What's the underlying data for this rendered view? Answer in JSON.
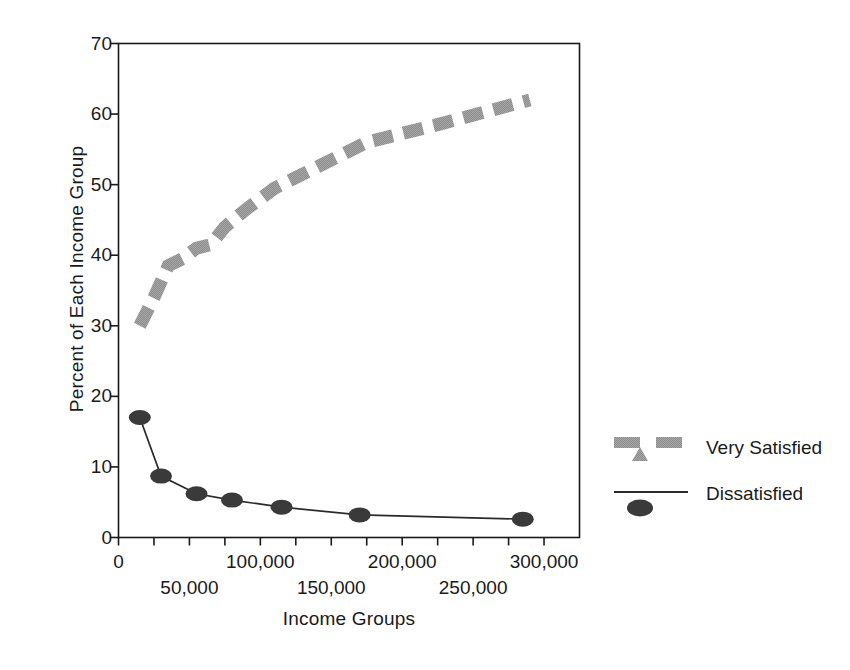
{
  "chart_data": {
    "type": "line",
    "title": "",
    "xlabel": "Income Groups",
    "ylabel": "Percent of Each Income Group",
    "xlim": [
      0,
      325000
    ],
    "ylim": [
      0,
      70
    ],
    "ytick_values": [
      0,
      10,
      20,
      30,
      40,
      50,
      60,
      70
    ],
    "ytick_labels": [
      "0",
      "10",
      "20",
      "30",
      "40",
      "50",
      "60",
      "70"
    ],
    "xtick_values": [
      0,
      25000,
      50000,
      75000,
      100000,
      125000,
      150000,
      175000,
      200000,
      225000,
      250000,
      275000,
      300000
    ],
    "xtick_labels_upper": [
      {
        "value": 0,
        "label": "0"
      },
      {
        "value": 100000,
        "label": "100,000"
      },
      {
        "value": 200000,
        "label": "200,000"
      },
      {
        "value": 300000,
        "label": "300,000"
      }
    ],
    "xtick_labels_lower": [
      {
        "value": 50000,
        "label": "50,000"
      },
      {
        "value": 150000,
        "label": "150,000"
      },
      {
        "value": 250000,
        "label": "250,000"
      }
    ],
    "grid": false,
    "legend_position": "right",
    "series": [
      {
        "name": "Very Satisfied",
        "color": "#8a8a8a",
        "style": "thick-dashed",
        "marker": "triangle",
        "x": [
          15000,
          25000,
          35000,
          45000,
          55000,
          65000,
          75000,
          90000,
          110000,
          135000,
          175000,
          225000,
          290000
        ],
        "values": [
          30,
          34,
          38.5,
          39.5,
          41,
          41.5,
          44,
          46.5,
          49.5,
          52,
          56,
          58.5,
          62
        ]
      },
      {
        "name": "Dissatisfied",
        "color": "#2a2a2a",
        "style": "thin-solid",
        "marker": "oval",
        "x": [
          15000,
          30000,
          55000,
          80000,
          115000,
          170000,
          285000
        ],
        "values": [
          17,
          8.7,
          6.2,
          5.3,
          4.3,
          3.2,
          2.6
        ]
      }
    ]
  },
  "legend": {
    "items": [
      {
        "label": "Very Satisfied"
      },
      {
        "label": "Dissatisfied"
      }
    ]
  }
}
